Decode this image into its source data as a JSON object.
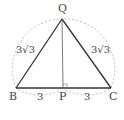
{
  "diagram": {
    "type": "geometry-triangle",
    "points": {
      "Q": {
        "label": "Q",
        "x": 62,
        "y": 19
      },
      "B": {
        "label": "B",
        "x": 16,
        "y": 88
      },
      "C": {
        "label": "C",
        "x": 111,
        "y": 88
      },
      "P": {
        "label": "P",
        "x": 63,
        "y": 88
      }
    },
    "edges": [
      {
        "from": "B",
        "to": "Q",
        "label": "3√3"
      },
      {
        "from": "Q",
        "to": "C",
        "label": "3√3"
      },
      {
        "from": "B",
        "to": "P",
        "label": "3"
      },
      {
        "from": "P",
        "to": "C",
        "label": "3"
      },
      {
        "from": "Q",
        "to": "P",
        "label": ""
      }
    ],
    "right_angle_at": "P",
    "labels": {
      "Q": "Q",
      "B": "B",
      "C": "C",
      "P": "P",
      "left_side": "3√3",
      "right_side": "3√3",
      "bp": "3",
      "pc": "3"
    },
    "colors": {
      "line": "#333333",
      "dashed": "#aaaaaa",
      "text": "#444444"
    }
  }
}
